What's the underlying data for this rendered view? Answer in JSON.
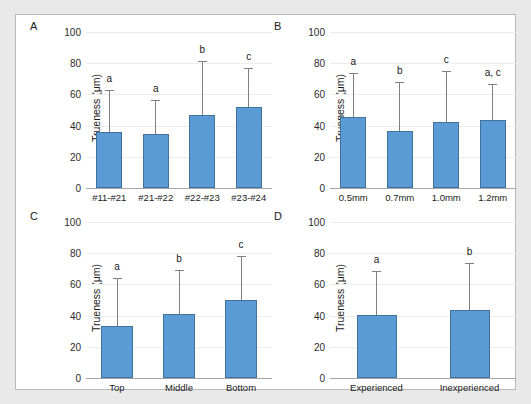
{
  "figure": {
    "background_color": "#e9e9e9",
    "frame_color": "#ffffff",
    "bar_color": "#5b9bd5",
    "bar_border_color": "#41719c",
    "error_bar_color": "#808080",
    "gridline_color": "#eceded",
    "axis_color": "#a6a6a6"
  },
  "chart_data": [
    {
      "type": "bar",
      "panel": "A",
      "title": "",
      "xlabel": "",
      "ylabel": "Trueness (μm)",
      "ylim": [
        0,
        100
      ],
      "yticks": [
        0,
        20,
        40,
        60,
        80,
        100
      ],
      "grid": true,
      "legend": "none",
      "categories": [
        "#11-#21",
        "#21-#22",
        "#22-#23",
        "#23-#24"
      ],
      "values": [
        36.0,
        34.5,
        46.5,
        52.0
      ],
      "errors_upper": [
        63.0,
        56.5,
        81.5,
        77.0
      ],
      "annotations": [
        "a",
        "a",
        "b",
        "c"
      ]
    },
    {
      "type": "bar",
      "panel": "B",
      "title": "",
      "xlabel": "",
      "ylabel": "Trueness (μm)",
      "ylim": [
        0,
        100
      ],
      "yticks": [
        0,
        20,
        40,
        60,
        80,
        100
      ],
      "grid": true,
      "legend": "none",
      "categories": [
        "0.5mm",
        "0.7mm",
        "1.0mm",
        "1.2mm"
      ],
      "values": [
        45.5,
        36.5,
        42.0,
        43.5
      ],
      "errors_upper": [
        74.0,
        68.0,
        75.0,
        66.5
      ],
      "annotations": [
        "a",
        "b",
        "c",
        "a, c"
      ]
    },
    {
      "type": "bar",
      "panel": "C",
      "title": "",
      "xlabel": "",
      "ylabel": "Trueness (μm)",
      "ylim": [
        0,
        100
      ],
      "yticks": [
        0,
        20,
        40,
        60,
        80,
        100
      ],
      "grid": true,
      "legend": "none",
      "categories": [
        "Top",
        "Middle",
        "Bottom"
      ],
      "values": [
        33.5,
        41.0,
        50.0
      ],
      "errors_upper": [
        64.0,
        69.0,
        78.0
      ],
      "annotations": [
        "a",
        "b",
        "c"
      ]
    },
    {
      "type": "bar",
      "panel": "D",
      "title": "",
      "xlabel": "",
      "ylabel": "Trueness (μm)",
      "ylim": [
        0,
        100
      ],
      "yticks": [
        0,
        20,
        40,
        60,
        80,
        100
      ],
      "grid": true,
      "legend": "none",
      "categories": [
        "Experienced",
        "Inexperienced"
      ],
      "values": [
        40.5,
        43.5
      ],
      "errors_upper": [
        68.5,
        74.0
      ],
      "annotations": [
        "a",
        "b"
      ]
    }
  ]
}
